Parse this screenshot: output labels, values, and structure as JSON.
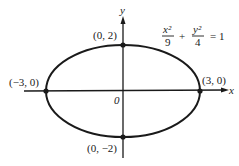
{
  "chart_data": {
    "type": "diagram",
    "title": "",
    "equation": {
      "x_num": "x²",
      "x_den": "9",
      "plus": "+",
      "y_num": "y²",
      "y_den": "4",
      "equals": "= 1"
    },
    "ellipse": {
      "a": 3,
      "b": 2,
      "center": [
        0,
        0
      ]
    },
    "axes": {
      "x_label": "x",
      "y_label": "y",
      "origin_label": "0"
    },
    "points": [
      {
        "label": "(0, 2)",
        "x": 0,
        "y": 2
      },
      {
        "label": "(0, −2)",
        "x": 0,
        "y": -2
      },
      {
        "label": "(−3, 0)",
        "x": -3,
        "y": 0
      },
      {
        "label": "(3, 0)",
        "x": 3,
        "y": 0
      }
    ]
  }
}
